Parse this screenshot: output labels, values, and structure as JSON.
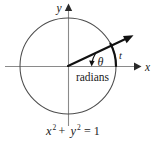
{
  "figure": {
    "kind": "unit-circle-radian-diagram",
    "background_color": "#ffffff",
    "ink_color": "#1a1a1a",
    "axis_color": "#7a7a7a",
    "circle_color": "#555555",
    "axes": {
      "x_label": "x",
      "y_label": "y",
      "origin": {
        "x": 68,
        "y": 66
      }
    },
    "circle": {
      "center_x": 68,
      "center_y": 66,
      "radius": 48,
      "equation": "x² + y² = 1",
      "equation_parts": {
        "x_base": "x",
        "x_exp": "2",
        "plus": "+",
        "y_base": "y",
        "y_exp": "2",
        "equals": "= 1"
      }
    },
    "angle": {
      "symbol": "θ",
      "unit_label": "radians",
      "arc_label": "t",
      "terminal_ray_degrees": 28
    }
  }
}
